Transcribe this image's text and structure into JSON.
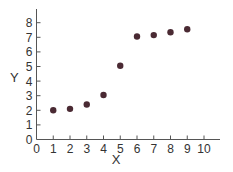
{
  "chart_data": {
    "type": "scatter",
    "title": "",
    "xlabel": "X",
    "ylabel": "Y",
    "xlim": [
      0,
      10.9
    ],
    "ylim": [
      0,
      8.8
    ],
    "x_ticks": [
      "0",
      "1",
      "2",
      "3",
      "4",
      "5",
      "6",
      "7",
      "8",
      "9",
      "10"
    ],
    "y_ticks": [
      "0",
      "1",
      "2",
      "3",
      "4",
      "5",
      "6",
      "7",
      "8"
    ],
    "grid": false,
    "legend": null,
    "marker_color": "#4a2a33",
    "x": [
      1,
      2,
      3,
      4,
      5,
      6,
      7,
      8,
      9
    ],
    "y": [
      2.0,
      2.1,
      2.4,
      3.05,
      5.05,
      7.05,
      7.15,
      7.35,
      7.55
    ]
  }
}
